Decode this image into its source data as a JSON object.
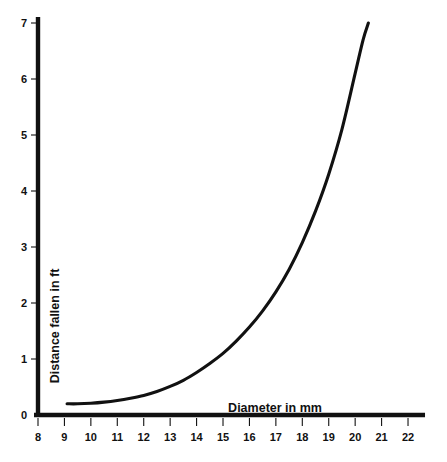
{
  "chart_data": {
    "type": "line",
    "title": "",
    "xlabel": "Diameter in mm",
    "ylabel": "Distance fallen in ft",
    "xlim": [
      8,
      22
    ],
    "ylim": [
      0,
      7
    ],
    "xticks": [
      8,
      9,
      10,
      11,
      12,
      13,
      14,
      15,
      16,
      17,
      18,
      19,
      20,
      21,
      22
    ],
    "yticks": [
      0,
      1,
      2,
      3,
      4,
      5,
      6,
      7
    ],
    "xtick_labels": [
      "8",
      "9",
      "10",
      "11",
      "12",
      "13",
      "14",
      "15",
      "16",
      "17",
      "18",
      "19",
      "20",
      "21",
      "22"
    ],
    "ytick_labels": [
      "0",
      "1",
      "2",
      "3",
      "4",
      "5",
      "6",
      "7"
    ],
    "grid": false,
    "legend": false,
    "series": [
      {
        "name": "Distance fallen",
        "x": [
          9.1,
          9.5,
          10.0,
          10.5,
          11.0,
          11.5,
          12.0,
          12.5,
          13.0,
          13.5,
          14.0,
          14.5,
          15.0,
          15.5,
          16.0,
          16.5,
          17.0,
          17.5,
          18.0,
          18.5,
          19.0,
          19.5,
          20.0,
          20.3,
          20.5
        ],
        "y": [
          0.2,
          0.2,
          0.21,
          0.23,
          0.26,
          0.3,
          0.35,
          0.42,
          0.51,
          0.62,
          0.76,
          0.92,
          1.1,
          1.32,
          1.57,
          1.86,
          2.2,
          2.6,
          3.08,
          3.64,
          4.3,
          5.1,
          6.1,
          6.7,
          7.0
        ]
      }
    ]
  },
  "axis_titles": {
    "x": "Diameter in mm",
    "y": "Distance fallen in ft"
  },
  "style": {
    "line_color": "#111111",
    "axis_color": "#111111",
    "background": "#ffffff"
  }
}
